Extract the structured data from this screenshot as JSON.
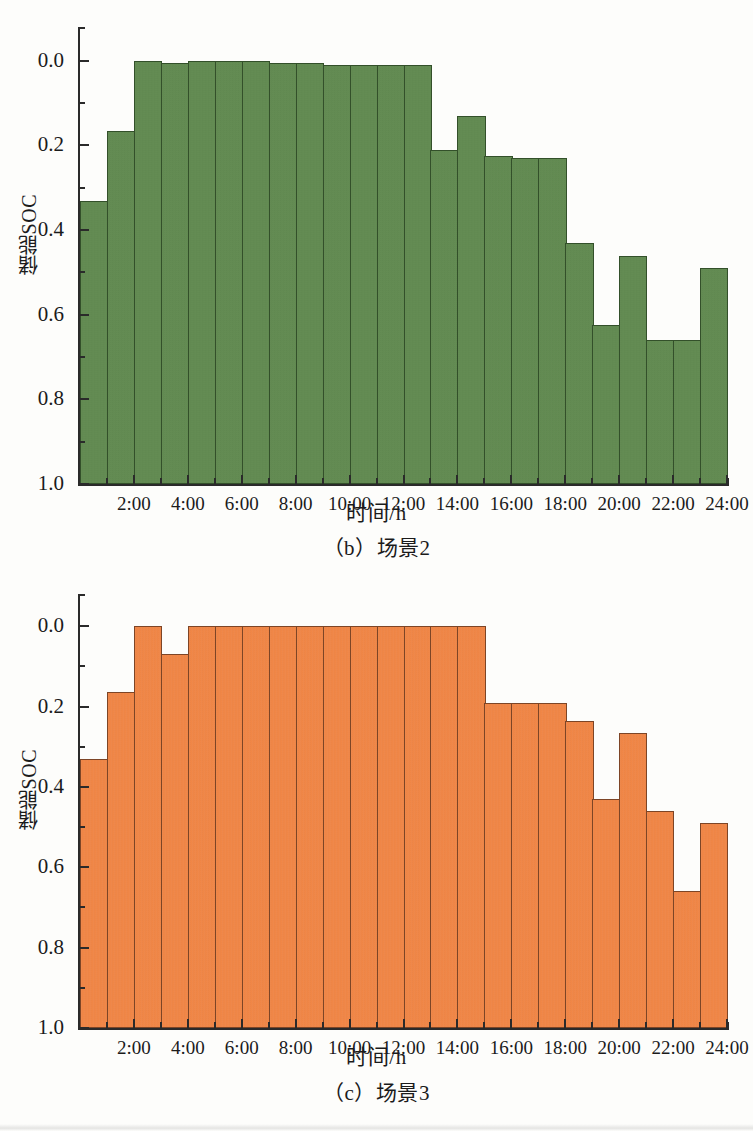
{
  "page": {
    "background": "#fdfdfb",
    "figure_count": 2
  },
  "figures": [
    {
      "id": "figure-b",
      "caption": "（b）场景2",
      "series_color": "#5e8a4c",
      "axis_title_x": "时间/h",
      "axis_title_y": "储能SOC"
    },
    {
      "id": "figure-c",
      "caption": "（c）场景3",
      "series_color": "#f4813c",
      "axis_title_x": "时间/h",
      "axis_title_y": "储能SOC"
    }
  ],
  "ytick_labels": [
    "1.0",
    "0.8",
    "0.6",
    "0.4",
    "0.2",
    "0.0"
  ],
  "xtick_labels": [
    "2:00",
    "4:00",
    "6:00",
    "8:00",
    "10:00",
    "12:00",
    "14:00",
    "16:00",
    "18:00",
    "20:00",
    "22:00",
    "24:00"
  ],
  "chart_data": [
    {
      "type": "bar",
      "title": "（b）场景2",
      "xlabel": "时间/h",
      "ylabel": "储能SOC",
      "ylim": [
        0.0,
        1.08
      ],
      "xlim": [
        0,
        24
      ],
      "yticks": [
        0.0,
        0.2,
        0.4,
        0.6,
        0.8,
        1.0
      ],
      "yticks_minor": [
        0.1,
        0.3,
        0.5,
        0.7,
        0.9
      ],
      "xticks": [
        2,
        4,
        6,
        8,
        10,
        12,
        14,
        16,
        18,
        20,
        22,
        24
      ],
      "grid": false,
      "legend": null,
      "bar_color": "#5e8a4c",
      "bar_edge_color": "#33502a",
      "categories": [
        "1:00",
        "2:00",
        "3:00",
        "4:00",
        "5:00",
        "6:00",
        "7:00",
        "8:00",
        "9:00",
        "10:00",
        "11:00",
        "12:00",
        "13:00",
        "14:00",
        "15:00",
        "16:00",
        "17:00",
        "18:00",
        "19:00",
        "20:00",
        "21:00",
        "22:00",
        "23:00",
        "24:00"
      ],
      "values": [
        0.67,
        0.835,
        1.0,
        0.995,
        1.0,
        1.0,
        1.0,
        0.995,
        0.995,
        0.99,
        0.99,
        0.99,
        0.99,
        0.79,
        0.87,
        0.775,
        0.77,
        0.77,
        0.57,
        0.375,
        0.54,
        0.34,
        0.34,
        0.51
      ]
    },
    {
      "type": "bar",
      "title": "（c）场景3",
      "xlabel": "时间/h",
      "ylabel": "储能SOC",
      "ylim": [
        0.0,
        1.08
      ],
      "xlim": [
        0,
        24
      ],
      "yticks": [
        0.0,
        0.2,
        0.4,
        0.6,
        0.8,
        1.0
      ],
      "yticks_minor": [
        0.1,
        0.3,
        0.5,
        0.7,
        0.9
      ],
      "xticks": [
        2,
        4,
        6,
        8,
        10,
        12,
        14,
        16,
        18,
        20,
        22,
        24
      ],
      "grid": false,
      "legend": null,
      "bar_color": "#f4813c",
      "bar_edge_color": "#7d4526",
      "categories": [
        "1:00",
        "2:00",
        "3:00",
        "4:00",
        "5:00",
        "6:00",
        "7:00",
        "8:00",
        "9:00",
        "10:00",
        "11:00",
        "12:00",
        "13:00",
        "14:00",
        "15:00",
        "16:00",
        "17:00",
        "18:00",
        "19:00",
        "20:00",
        "21:00",
        "22:00",
        "23:00",
        "24:00"
      ],
      "values": [
        0.67,
        0.835,
        1.0,
        0.93,
        1.0,
        1.0,
        1.0,
        1.0,
        1.0,
        1.0,
        1.0,
        1.0,
        1.0,
        1.0,
        1.0,
        0.81,
        0.81,
        0.81,
        0.765,
        0.57,
        0.735,
        0.54,
        0.34,
        0.51
      ]
    }
  ]
}
